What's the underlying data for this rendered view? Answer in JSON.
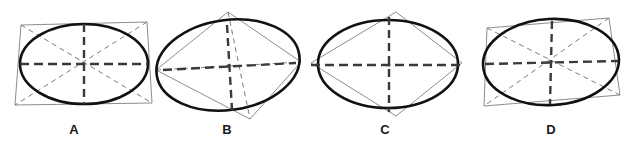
{
  "figure": {
    "background_color": "#ffffff",
    "outline_color": "#111111",
    "quad_color": "#8d8d8d",
    "axis_color": "#3a3a3a",
    "diagonal_color": "#7c7c7c",
    "label_color": "#1a1a1a"
  },
  "panels": [
    {
      "id": "A",
      "label": "A",
      "label_x": 74,
      "label_y": 134,
      "description": "Ellipse inscribed in a slightly skewed rectangle with dashed major/minor axes and dashed diagonals",
      "quad_points": "21,25 147,22 152,103 15,105",
      "ellipse": {
        "cx": 84,
        "cy": 64,
        "rx": 64,
        "ry": 40,
        "rotation": 0
      },
      "axes": [
        {
          "name": "major-axis",
          "x1": 20,
          "y1": 64,
          "x2": 148,
          "y2": 64
        },
        {
          "name": "minor-axis",
          "x1": 84,
          "y1": 24,
          "x2": 84,
          "y2": 104
        }
      ],
      "diagonals": [
        {
          "name": "diagonal-1",
          "x1": 21,
          "y1": 25,
          "x2": 152,
          "y2": 103
        },
        {
          "name": "diagonal-2",
          "x1": 147,
          "y1": 22,
          "x2": 15,
          "y2": 105
        }
      ],
      "center": {
        "cx": 84,
        "cy": 64
      }
    },
    {
      "id": "B",
      "label": "B",
      "label_x": 227,
      "label_y": 134,
      "description": "Ellipse in a tilted diamond with skewed, non-perpendicular dashed axes",
      "quad_points": "228,12 301,62 250,119 156,70",
      "ellipse": {
        "cx": 228,
        "cy": 65,
        "rx": 72,
        "ry": 45,
        "rotation": -8
      },
      "axes": [
        {
          "name": "major-axis",
          "x1": 163,
          "y1": 70,
          "x2": 296,
          "y2": 63
        },
        {
          "name": "minor-axis",
          "x1": 227,
          "y1": 25,
          "x2": 232,
          "y2": 110
        }
      ],
      "diagonals": [
        {
          "name": "diagonal-1",
          "x1": 228,
          "y1": 12,
          "x2": 250,
          "y2": 119
        },
        {
          "name": "diagonal-2",
          "x1": 156,
          "y1": 70,
          "x2": 301,
          "y2": 62
        }
      ],
      "center": {
        "cx": 228,
        "cy": 66
      }
    },
    {
      "id": "C",
      "label": "C",
      "label_x": 385,
      "label_y": 134,
      "description": "Ellipse overlapping a symmetric diamond with dashed horizontal and vertical axes",
      "quad_points": "396,12 462,63 396,116 311,63",
      "ellipse": {
        "cx": 388,
        "cy": 64,
        "rx": 70,
        "ry": 44,
        "rotation": 0
      },
      "axes": [
        {
          "name": "major-axis",
          "x1": 311,
          "y1": 65,
          "x2": 462,
          "y2": 65
        },
        {
          "name": "minor-axis",
          "x1": 389,
          "y1": 17,
          "x2": 389,
          "y2": 112
        }
      ],
      "diagonals": [],
      "center": {
        "cx": 389,
        "cy": 65
      }
    },
    {
      "id": "D",
      "label": "D",
      "label_x": 551,
      "label_y": 134,
      "description": "Ellipse inscribed in a tilted quadrilateral with dashed axes and dashed diagonals",
      "quad_points": "487,28 609,18 620,95 484,106",
      "ellipse": {
        "cx": 551,
        "cy": 62,
        "rx": 68,
        "ry": 43,
        "rotation": -3
      },
      "axes": [
        {
          "name": "major-axis",
          "x1": 485,
          "y1": 64,
          "x2": 618,
          "y2": 61
        },
        {
          "name": "minor-axis",
          "x1": 552,
          "y1": 21,
          "x2": 550,
          "y2": 104
        }
      ],
      "diagonals": [
        {
          "name": "diagonal-1",
          "x1": 487,
          "y1": 28,
          "x2": 620,
          "y2": 95
        },
        {
          "name": "diagonal-2",
          "x1": 609,
          "y1": 18,
          "x2": 484,
          "y2": 106
        }
      ],
      "center": {
        "cx": 551,
        "cy": 62
      }
    }
  ]
}
